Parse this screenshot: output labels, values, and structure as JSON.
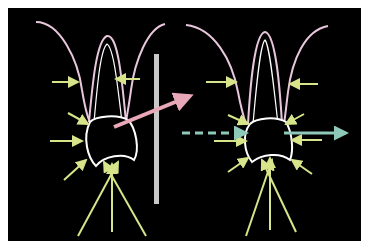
{
  "diagram": {
    "title": "",
    "background": "#000000",
    "frame": {
      "x": 8,
      "y": 8,
      "width": 353,
      "height": 233
    },
    "colors": {
      "gingiva": "#e8c6dc",
      "tooth_outline": "#ffffff",
      "force_arrow": "#d8e48a",
      "tilt_arrow": "#e8a8b8",
      "translation_arrow": "#8ec8b8",
      "barrier": "#c8c8c8"
    },
    "panels": [
      {
        "name": "left-tooth",
        "description": "Tooth with tipping force (pink arrow) and reaction forces (yellow arrows)"
      },
      {
        "name": "right-tooth",
        "description": "Tooth with bodily translation (teal arrow through crown) and reaction forces (yellow arrows)"
      }
    ],
    "labels": []
  }
}
